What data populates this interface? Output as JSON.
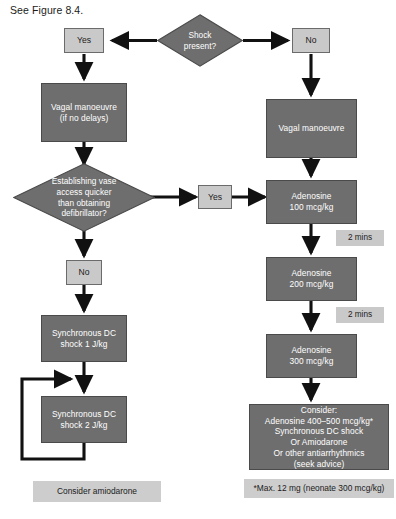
{
  "figure": {
    "caption": "See Figure 8.4.",
    "type": "flowchart",
    "topic": "Paediatric SVT (supraventricular tachycardia) algorithm",
    "colors": {
      "process_fill": "#6e6e6e",
      "process_text": "#ffffff",
      "label_fill": "#c9c9c9",
      "label_text": "#1b1b1b",
      "connector": "#111111",
      "background": "#ffffff"
    }
  },
  "nodes": {
    "shock_present": {
      "label": "Shock\npresent?",
      "shape": "diamond"
    },
    "yes_left": {
      "label": "Yes",
      "shape": "label-box"
    },
    "no_right": {
      "label": "No",
      "shape": "label-box"
    },
    "vagal_left": {
      "label": "Vagal manoeuvre\n(if no delays)",
      "shape": "process"
    },
    "vagal_right": {
      "label": "Vagal manoeuvre",
      "shape": "process"
    },
    "vascular_access": {
      "label": "Establishing vase\naccess quicker\nthan obtaining\ndefibrillator?",
      "shape": "diamond"
    },
    "yes_mid": {
      "label": "Yes",
      "shape": "label-box"
    },
    "no_left": {
      "label": "No",
      "shape": "label-box"
    },
    "dc_shock_1": {
      "label": "Synchronous DC\nshock 1 J/kg",
      "shape": "process"
    },
    "dc_shock_2": {
      "label": "Synchronous DC\nshock 2 J/kg",
      "shape": "process"
    },
    "consider_amiodarone": {
      "label": "Consider amiodarone",
      "shape": "flat-label"
    },
    "adenosine_100": {
      "label": "Adenosine\n100 mcg/kg",
      "shape": "process"
    },
    "adenosine_200": {
      "label": "Adenosine\n200 mcg/kg",
      "shape": "process"
    },
    "adenosine_300": {
      "label": "Adenosine\n300 mcg/kg",
      "shape": "process"
    },
    "consider_block": {
      "shape": "process",
      "lines": [
        "Consider:",
        "Adenosine 400–500 mcg/kg*",
        "Synchronous DC shock",
        "Or Amiodarone",
        "Or other antiarrhythmics",
        "(seek advice)"
      ]
    },
    "footnote": {
      "label": "*Max. 12 mg (neonate 300 mcg/kg)",
      "shape": "flat-label"
    }
  },
  "timing_tags": [
    {
      "label": "2 mins"
    },
    {
      "label": "2 mins"
    }
  ]
}
